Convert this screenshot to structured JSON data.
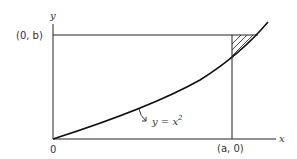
{
  "diagram": {
    "axis_y_label": "y",
    "axis_x_label": "x",
    "origin_label": "0",
    "point_b_label": "(0, b)",
    "point_a_label": "(a, 0)",
    "curve_label": "y = x",
    "curve_label_exp": "2",
    "colors": {
      "line": "#222222",
      "background": "#ffffff"
    }
  }
}
